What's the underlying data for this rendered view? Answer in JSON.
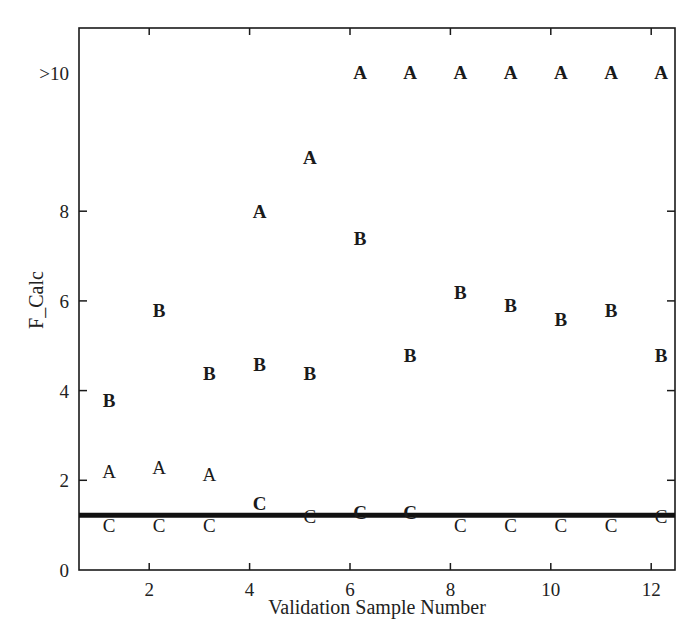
{
  "chart_data": {
    "type": "scatter",
    "title": "",
    "xlabel": "Validation Sample Number",
    "ylabel": "F_Calc",
    "xlim": [
      0.6,
      12.4
    ],
    "ylim": [
      0,
      10.5
    ],
    "xticks": [
      2,
      4,
      6,
      8,
      10,
      12
    ],
    "yticks": [
      {
        "value": 0,
        "label": "0"
      },
      {
        "value": 2,
        "label": "2"
      },
      {
        "value": 4,
        "label": "4"
      },
      {
        "value": 6,
        "label": "6"
      },
      {
        "value": 8,
        "label": "8"
      },
      {
        "value": 10.8,
        "label": ">10"
      }
    ],
    "grid": false,
    "legend": null,
    "reference_line": {
      "y": 1.22,
      "orientation": "horizontal",
      "style": "thick solid black"
    },
    "series": [
      {
        "name": "A",
        "marker_text": "A",
        "style": "mixed",
        "points": [
          {
            "x": 1,
            "y": 2.2,
            "bold": false
          },
          {
            "x": 2,
            "y": 2.3,
            "bold": false
          },
          {
            "x": 3,
            "y": 2.15,
            "bold": false
          },
          {
            "x": 4,
            "y": 8.0,
            "bold": true
          },
          {
            "x": 5,
            "y": 9.2,
            "bold": true
          },
          {
            "x": 6,
            "y": ">10",
            "plot_y": 10.8,
            "bold": true
          },
          {
            "x": 7,
            "y": ">10",
            "plot_y": 10.8,
            "bold": true
          },
          {
            "x": 8,
            "y": ">10",
            "plot_y": 10.8,
            "bold": true
          },
          {
            "x": 9,
            "y": ">10",
            "plot_y": 10.8,
            "bold": true
          },
          {
            "x": 10,
            "y": ">10",
            "plot_y": 10.8,
            "bold": true
          },
          {
            "x": 11,
            "y": ">10",
            "plot_y": 10.8,
            "bold": true
          },
          {
            "x": 12,
            "y": ">10",
            "plot_y": 10.8,
            "bold": true
          }
        ]
      },
      {
        "name": "B",
        "marker_text": "B",
        "style": "bold",
        "points": [
          {
            "x": 1,
            "y": 3.8,
            "bold": true
          },
          {
            "x": 2,
            "y": 5.8,
            "bold": true
          },
          {
            "x": 3,
            "y": 4.4,
            "bold": true
          },
          {
            "x": 4,
            "y": 4.6,
            "bold": true
          },
          {
            "x": 5,
            "y": 4.4,
            "bold": true
          },
          {
            "x": 6,
            "y": 7.4,
            "bold": true
          },
          {
            "x": 7,
            "y": 4.8,
            "bold": true
          },
          {
            "x": 8,
            "y": 6.2,
            "bold": true
          },
          {
            "x": 9,
            "y": 5.9,
            "bold": true
          },
          {
            "x": 10,
            "y": 5.6,
            "bold": true
          },
          {
            "x": 11,
            "y": 5.8,
            "bold": true
          },
          {
            "x": 12,
            "y": 4.8,
            "bold": true
          }
        ]
      },
      {
        "name": "C",
        "marker_text": "C",
        "style": "mixed",
        "points": [
          {
            "x": 1,
            "y": 1.0,
            "bold": false
          },
          {
            "x": 2,
            "y": 1.0,
            "bold": false
          },
          {
            "x": 3,
            "y": 1.0,
            "bold": false
          },
          {
            "x": 4,
            "y": 1.5,
            "bold": true
          },
          {
            "x": 5,
            "y": 1.2,
            "bold": false
          },
          {
            "x": 6,
            "y": 1.3,
            "bold": true
          },
          {
            "x": 7,
            "y": 1.3,
            "bold": true
          },
          {
            "x": 8,
            "y": 1.0,
            "bold": false
          },
          {
            "x": 9,
            "y": 1.0,
            "bold": false
          },
          {
            "x": 10,
            "y": 1.0,
            "bold": false
          },
          {
            "x": 11,
            "y": 1.0,
            "bold": false
          },
          {
            "x": 12,
            "y": 1.2,
            "bold": false
          }
        ]
      }
    ]
  }
}
